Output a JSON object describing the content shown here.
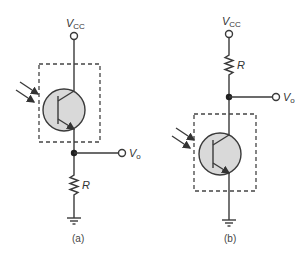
{
  "figure": {
    "panels": [
      {
        "id": "a",
        "caption": "(a)",
        "supply_label": "V",
        "supply_sub": "CC",
        "output_label": "V",
        "output_sub": "o",
        "resistor_label": "R",
        "configuration": "emitter-follower: phototransistor between VCC and output, resistor R from output to ground"
      },
      {
        "id": "b",
        "caption": "(b)",
        "supply_label": "V",
        "supply_sub": "CC",
        "output_label": "V",
        "output_sub": "o",
        "resistor_label": "R",
        "configuration": "common-emitter: resistor R from VCC to output, phototransistor from output to ground"
      }
    ]
  },
  "colors": {
    "line": "#3a3a3a",
    "transistor_fill": "#d9d9d9",
    "background": "#ffffff"
  }
}
